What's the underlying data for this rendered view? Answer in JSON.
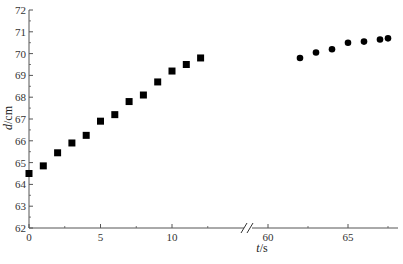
{
  "chart_data": {
    "type": "scatter",
    "title": "",
    "xlabel": "t/s",
    "xlabel_italic": "t",
    "xlabel_unit": "/s",
    "ylabel": "d/cm",
    "ylabel_italic": "d",
    "ylabel_unit": "/cm",
    "ylim": [
      62,
      72
    ],
    "y_ticks": [
      62,
      63,
      64,
      65,
      66,
      67,
      68,
      69,
      70,
      71,
      72
    ],
    "x_axis_break": true,
    "x_segments": [
      {
        "range": [
          0,
          13.5
        ],
        "ticks": [
          0,
          5,
          10
        ]
      },
      {
        "range": [
          58.8,
          68
        ],
        "ticks": [
          60,
          65
        ]
      }
    ],
    "grid": false,
    "legend": null,
    "series": [
      {
        "name": "segment-1",
        "marker": "square",
        "color": "#000000",
        "x": [
          0,
          1,
          2,
          3,
          4,
          5,
          6,
          7,
          8,
          9,
          10,
          11,
          12
        ],
        "y": [
          64.5,
          64.85,
          65.45,
          65.9,
          66.25,
          66.9,
          67.2,
          67.8,
          68.1,
          68.7,
          69.2,
          69.5,
          69.8
        ]
      },
      {
        "name": "segment-2",
        "marker": "circle",
        "color": "#000000",
        "x": [
          62,
          63,
          64,
          65,
          66,
          67,
          67.5
        ],
        "y": [
          69.8,
          70.05,
          70.2,
          70.5,
          70.55,
          70.65,
          70.7
        ]
      }
    ]
  }
}
